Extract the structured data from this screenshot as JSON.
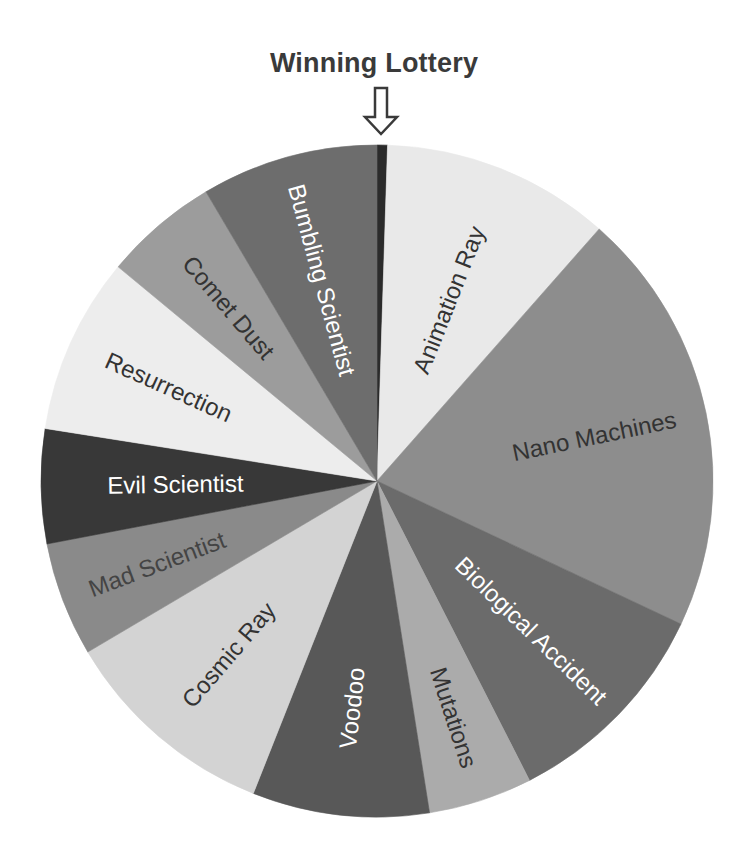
{
  "chart_data": {
    "type": "pie",
    "title": "Winning Lottery",
    "annotation": {
      "type": "arrow",
      "direction": "down",
      "points_to": "Winning Lottery",
      "label": "Winning Lottery"
    },
    "start_angle_deg": 0,
    "direction": "clockwise",
    "legend": "none (labels drawn inside slices)",
    "slices": [
      {
        "label": "Winning Lottery",
        "value": 0.5,
        "color": "#2b2b2b",
        "text_color": "#ffffff",
        "show_label": false
      },
      {
        "label": "Animation Ray",
        "value": 11,
        "color": "#e9e9e9",
        "text_color": "#333333",
        "show_label": true
      },
      {
        "label": "Nano Machines",
        "value": 20.5,
        "color": "#8d8d8d",
        "text_color": "#333333",
        "show_label": true
      },
      {
        "label": "Biological Accident",
        "value": 10.5,
        "color": "#6b6b6b",
        "text_color": "#ffffff",
        "show_label": true
      },
      {
        "label": "Mutations",
        "value": 5,
        "color": "#ababab",
        "text_color": "#333333",
        "show_label": true
      },
      {
        "label": "Voodoo",
        "value": 8.5,
        "color": "#585858",
        "text_color": "#ffffff",
        "show_label": true
      },
      {
        "label": "Cosmic Ray",
        "value": 10.5,
        "color": "#d3d3d3",
        "text_color": "#333333",
        "show_label": true
      },
      {
        "label": "Mad Scientist",
        "value": 5.5,
        "color": "#8a8a8a",
        "text_color": "#444444",
        "show_label": true
      },
      {
        "label": "Evil Scientist",
        "value": 5.5,
        "color": "#383838",
        "text_color": "#ffffff",
        "show_label": true
      },
      {
        "label": "Resurrection",
        "value": 8.5,
        "color": "#ededed",
        "text_color": "#333333",
        "show_label": true
      },
      {
        "label": "Comet Dust",
        "value": 5.5,
        "color": "#9c9c9c",
        "text_color": "#333333",
        "show_label": true
      },
      {
        "label": "Bumbling Scientist",
        "value": 8.5,
        "color": "#6d6d6d",
        "text_color": "#ffffff",
        "show_label": true
      }
    ],
    "units": "percent (estimated from slice angles)"
  },
  "title": "Winning Lottery"
}
